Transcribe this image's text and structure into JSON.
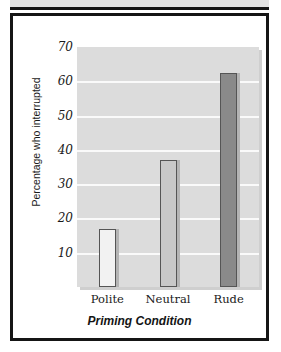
{
  "figure": {
    "panel_border_color": "#151515",
    "top_band_color": "#e3e3e3",
    "background_color": "#ffffff"
  },
  "chart_data": {
    "type": "bar",
    "title": "",
    "subtitle": "",
    "xlabel": "Priming Condition",
    "ylabel": "Percentage who interrupted",
    "categories": [
      "Polite",
      "Neutral",
      "Rude"
    ],
    "values": [
      17,
      37,
      62.5
    ],
    "bar_colors": [
      "#f2f2f2",
      "#c8c8c8",
      "#8a8a8a"
    ],
    "bar_edge_color": "#555555",
    "ylim": [
      0,
      70
    ],
    "yticks": [
      10,
      20,
      30,
      40,
      50,
      60,
      70
    ],
    "ytick_labels": [
      "10",
      "20",
      "30",
      "40",
      "50",
      "60",
      "70"
    ],
    "grid": true,
    "grid_color": "#fafafa",
    "plot_background": "#dcdcdc",
    "legend": false,
    "legend_position": "none",
    "annotations": []
  },
  "axis": {
    "y_label_text": "Percentage who interrupted",
    "x_label_text": "Priming Condition"
  }
}
